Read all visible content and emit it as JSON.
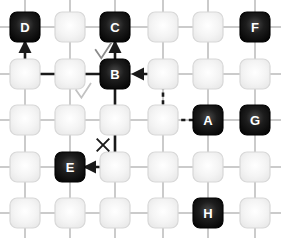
{
  "diagram": {
    "grid": {
      "columns": 6,
      "rows": 5,
      "col_x": [
        25,
        70,
        115,
        163,
        208,
        255
      ],
      "row_y": [
        27,
        74,
        120,
        167,
        213
      ],
      "node_size": 30,
      "node_radius": 7,
      "empty_fill": "#f2f2f2",
      "empty_stroke": "#d8d8d8",
      "labeled_fill": "#141414",
      "labeled_stroke": "#000000",
      "label_color": "#ffffff",
      "edge_color": "#b5b5b5"
    },
    "nodes": [
      {
        "id": "D",
        "label": "D",
        "col": 1,
        "row": 1,
        "type": "labeled"
      },
      {
        "id": "n2_1",
        "label": "",
        "col": 2,
        "row": 1,
        "type": "empty"
      },
      {
        "id": "C",
        "label": "C",
        "col": 3,
        "row": 1,
        "type": "labeled"
      },
      {
        "id": "n4_1",
        "label": "",
        "col": 4,
        "row": 1,
        "type": "empty"
      },
      {
        "id": "n5_1",
        "label": "",
        "col": 5,
        "row": 1,
        "type": "empty"
      },
      {
        "id": "F",
        "label": "F",
        "col": 6,
        "row": 1,
        "type": "labeled"
      },
      {
        "id": "n1_2",
        "label": "",
        "col": 1,
        "row": 2,
        "type": "empty"
      },
      {
        "id": "n2_2",
        "label": "",
        "col": 2,
        "row": 2,
        "type": "empty"
      },
      {
        "id": "B",
        "label": "B",
        "col": 3,
        "row": 2,
        "type": "labeled"
      },
      {
        "id": "n4_2",
        "label": "",
        "col": 4,
        "row": 2,
        "type": "empty"
      },
      {
        "id": "n5_2",
        "label": "",
        "col": 5,
        "row": 2,
        "type": "empty"
      },
      {
        "id": "n6_2",
        "label": "",
        "col": 6,
        "row": 2,
        "type": "empty"
      },
      {
        "id": "n1_3",
        "label": "",
        "col": 1,
        "row": 3,
        "type": "empty"
      },
      {
        "id": "n2_3",
        "label": "",
        "col": 2,
        "row": 3,
        "type": "empty"
      },
      {
        "id": "n3_3",
        "label": "",
        "col": 3,
        "row": 3,
        "type": "empty"
      },
      {
        "id": "n4_3",
        "label": "",
        "col": 4,
        "row": 3,
        "type": "empty"
      },
      {
        "id": "A",
        "label": "A",
        "col": 5,
        "row": 3,
        "type": "labeled"
      },
      {
        "id": "G",
        "label": "G",
        "col": 6,
        "row": 3,
        "type": "labeled"
      },
      {
        "id": "n1_4",
        "label": "",
        "col": 1,
        "row": 4,
        "type": "empty"
      },
      {
        "id": "E",
        "label": "E",
        "col": 2,
        "row": 4,
        "type": "labeled"
      },
      {
        "id": "n3_4",
        "label": "",
        "col": 3,
        "row": 4,
        "type": "empty"
      },
      {
        "id": "n4_4",
        "label": "",
        "col": 4,
        "row": 4,
        "type": "empty"
      },
      {
        "id": "n5_4",
        "label": "",
        "col": 5,
        "row": 4,
        "type": "empty"
      },
      {
        "id": "n6_4",
        "label": "",
        "col": 6,
        "row": 4,
        "type": "empty"
      },
      {
        "id": "n1_5",
        "label": "",
        "col": 1,
        "row": 5,
        "type": "empty"
      },
      {
        "id": "n2_5",
        "label": "",
        "col": 2,
        "row": 5,
        "type": "empty"
      },
      {
        "id": "n3_5",
        "label": "",
        "col": 3,
        "row": 5,
        "type": "empty"
      },
      {
        "id": "n4_5",
        "label": "",
        "col": 4,
        "row": 5,
        "type": "empty"
      },
      {
        "id": "H",
        "label": "H",
        "col": 5,
        "row": 5,
        "type": "labeled"
      },
      {
        "id": "n6_5",
        "label": "",
        "col": 6,
        "row": 5,
        "type": "empty"
      }
    ],
    "paths": [
      {
        "id": "path-b-to-c",
        "style": "solid",
        "color": "#1a1a1a",
        "width": 2.6,
        "arrow": "end",
        "from": "B",
        "to": "C",
        "points": [
          [
            115,
            60
          ],
          [
            115,
            42
          ]
        ]
      },
      {
        "id": "path-b-to-d",
        "style": "solid",
        "color": "#1a1a1a",
        "width": 2.6,
        "arrow": "end",
        "from": "B",
        "to": "D",
        "points": [
          [
            100,
            74
          ],
          [
            25,
            74
          ],
          [
            25,
            42
          ]
        ]
      },
      {
        "id": "path-b-to-e",
        "style": "solid",
        "color": "#1a1a1a",
        "width": 2.6,
        "arrow": "end",
        "from": "B",
        "to": "E",
        "points": [
          [
            115,
            89
          ],
          [
            115,
            167
          ],
          [
            85,
            167
          ]
        ]
      },
      {
        "id": "path-a-to-b",
        "style": "dashed",
        "color": "#1a1a1a",
        "width": 2.6,
        "arrow": "end",
        "from": "A",
        "to": "B",
        "points": [
          [
            193,
            120
          ],
          [
            163,
            120
          ],
          [
            163,
            74
          ],
          [
            133,
            74
          ]
        ]
      }
    ],
    "annotations": [
      {
        "id": "check-1",
        "glyph": "check",
        "x": 103,
        "y": 51,
        "size": 17,
        "color": "#8a8a8a",
        "stroke_width": 1.8
      },
      {
        "id": "check-2",
        "glyph": "check",
        "x": 83,
        "y": 91,
        "size": 16,
        "color": "#c2c2c2",
        "stroke_width": 1.8
      },
      {
        "id": "cross-1",
        "glyph": "cross",
        "x": 103,
        "y": 145,
        "size": 15,
        "color": "#1a1a1a",
        "stroke_width": 1.9
      }
    ]
  }
}
